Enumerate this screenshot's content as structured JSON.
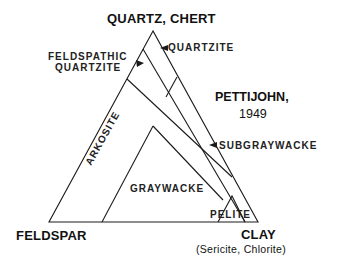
{
  "diagram": {
    "type": "ternary-classification",
    "vertices": {
      "top": "QUARTZ, CHERT",
      "bottom_left": "FELDSPAR",
      "bottom_right": "CLAY",
      "bottom_right_note": "(Sericite, Chlorite)"
    },
    "citation": {
      "author": "PETTIJOHN,",
      "year": "1949"
    },
    "fields": {
      "quartzite": "QUARTZITE",
      "feldspathic_quartzite_line1": "FELDSPATHIC",
      "feldspathic_quartzite_line2": "QUARTZITE",
      "arkosite": "ARKOSITE",
      "graywacke": "GRAYWACKE",
      "subgraywacke": "SUBGRAYWACKE",
      "pelite": "PELITE"
    },
    "colors": {
      "line": "#1a1a1a",
      "background": "#ffffff"
    }
  }
}
